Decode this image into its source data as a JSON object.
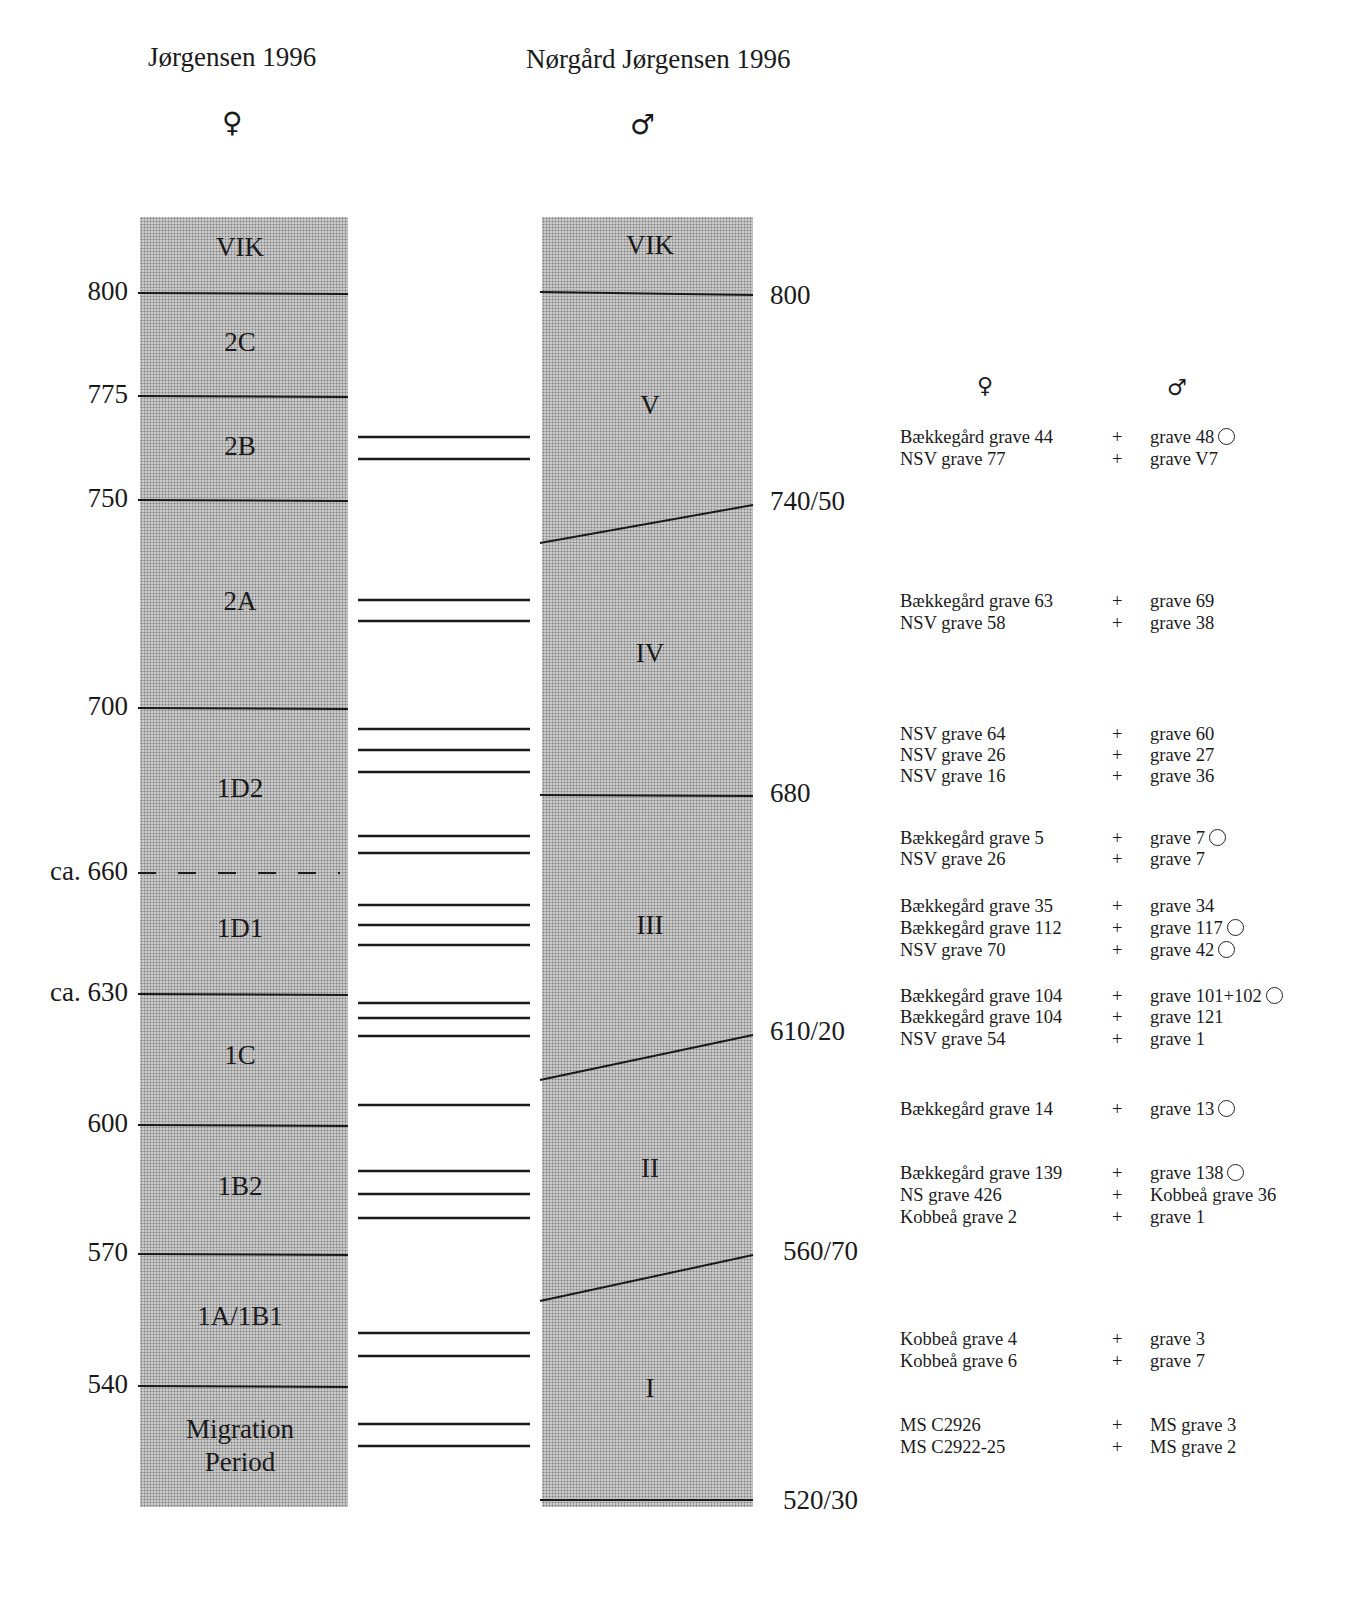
{
  "header": {
    "left_title": "Jørgensen 1996",
    "left_symbol": "♀",
    "right_title": "Nørgård Jørgensen 1996",
    "right_symbol": "♂"
  },
  "left_column": {
    "phases": [
      {
        "label": "VIK",
        "y": 249
      },
      {
        "label": "2C",
        "y": 344
      },
      {
        "label": "2B",
        "y": 448
      },
      {
        "label": "2A",
        "y": 603
      },
      {
        "label": "1D2",
        "y": 790
      },
      {
        "label": "1D1",
        "y": 930
      },
      {
        "label": "1C",
        "y": 1057
      },
      {
        "label": "1B2",
        "y": 1188
      },
      {
        "label": "1A/1B1",
        "y": 1318
      },
      {
        "label": "Migration",
        "y": 1430
      },
      {
        "label": "Period",
        "y": 1463
      }
    ],
    "boundaries": [
      {
        "label": "800",
        "y": 293,
        "style": "solid"
      },
      {
        "label": "775",
        "y": 396,
        "style": "solid"
      },
      {
        "label": "750",
        "y": 500,
        "style": "solid"
      },
      {
        "label": "700",
        "y": 708,
        "style": "solid"
      },
      {
        "label": "ca. 660",
        "y": 873,
        "style": "dashed"
      },
      {
        "label": "ca. 630",
        "y": 994,
        "style": "solid"
      },
      {
        "label": "600",
        "y": 1125,
        "style": "solid"
      },
      {
        "label": "570",
        "y": 1254,
        "style": "solid"
      },
      {
        "label": "540",
        "y": 1386,
        "style": "solid"
      }
    ]
  },
  "right_column": {
    "phases": [
      {
        "label": "VIK",
        "y": 247
      },
      {
        "label": "V",
        "y": 407
      },
      {
        "label": "IV",
        "y": 655
      },
      {
        "label": "III",
        "y": 927
      },
      {
        "label": "II",
        "y": 1170
      },
      {
        "label": "I",
        "y": 1390
      }
    ],
    "boundaries": [
      {
        "label": "800",
        "y_left": 292,
        "y_right": 295,
        "label_y": 297
      },
      {
        "label": "740/50",
        "y_left": 543,
        "y_right": 505,
        "label_y": 503
      },
      {
        "label": "680",
        "y_left": 795,
        "y_right": 796,
        "label_y": 795
      },
      {
        "label": "610/20",
        "y_left": 1080,
        "y_right": 1035,
        "label_y": 1033
      },
      {
        "label": "560/70",
        "y_left": 1301,
        "y_right": 1255,
        "label_y": 1253
      },
      {
        "label": "520/30",
        "y_left": 1500,
        "y_right": 1500,
        "label_y": 1502
      }
    ]
  },
  "links": [
    437,
    459,
    600,
    621,
    729,
    750,
    772,
    836,
    853,
    905,
    925,
    945,
    1003,
    1018,
    1036,
    1105,
    1171,
    1194,
    1218,
    1333,
    1356,
    1424,
    1446
  ],
  "pairs_header": {
    "female": "♀",
    "male": "♂"
  },
  "pairs": [
    {
      "female": "Bækkegård grave 44",
      "male": "grave 48",
      "circle": true,
      "y": 438
    },
    {
      "female": "NSV grave 77",
      "male": "grave V7",
      "circle": false,
      "y": 460
    },
    {
      "female": "Bækkegård grave 63",
      "male": "grave 69",
      "circle": false,
      "y": 602
    },
    {
      "female": "NSV grave 58",
      "male": "grave 38",
      "circle": false,
      "y": 624
    },
    {
      "female": "NSV grave 64",
      "male": "grave 60",
      "circle": false,
      "y": 735
    },
    {
      "female": "NSV grave 26",
      "male": "grave 27",
      "circle": false,
      "y": 756
    },
    {
      "female": "NSV grave 16",
      "male": "grave 36",
      "circle": false,
      "y": 777
    },
    {
      "female": "Bækkegård grave 5",
      "male": "grave 7",
      "circle": true,
      "y": 839
    },
    {
      "female": "NSV grave 26",
      "male": "grave 7",
      "circle": false,
      "y": 860
    },
    {
      "female": "Bækkegård grave 35",
      "male": "grave 34",
      "circle": false,
      "y": 907
    },
    {
      "female": "Bækkegård grave 112",
      "male": "grave 117",
      "circle": true,
      "y": 929
    },
    {
      "female": "NSV grave 70",
      "male": "grave 42",
      "circle": true,
      "y": 951
    },
    {
      "female": "Bækkegård grave 104",
      "male": "grave 101+102",
      "circle": true,
      "y": 997
    },
    {
      "female": "Bækkegård grave 104",
      "male": "grave 121",
      "circle": false,
      "y": 1018
    },
    {
      "female": "NSV grave 54",
      "male": "grave 1",
      "circle": false,
      "y": 1040
    },
    {
      "female": "Bækkegård grave 14",
      "male": "grave 13",
      "circle": true,
      "y": 1110
    },
    {
      "female": "Bækkegård grave 139",
      "male": "grave 138",
      "circle": true,
      "y": 1174
    },
    {
      "female": "NS grave 426",
      "male": "Kobbeå grave 36",
      "circle": false,
      "y": 1196
    },
    {
      "female": "Kobbeå grave 2",
      "male": "grave 1",
      "circle": false,
      "y": 1218
    },
    {
      "female": "Kobbeå grave 4",
      "male": "grave 3",
      "circle": false,
      "y": 1340
    },
    {
      "female": "Kobbeå grave 6",
      "male": "grave 7",
      "circle": false,
      "y": 1362
    },
    {
      "female": "MS C2926",
      "male": "MS grave 3",
      "circle": false,
      "y": 1426
    },
    {
      "female": "MS C2922-25",
      "male": "MS grave 2",
      "circle": false,
      "y": 1448
    }
  ],
  "plus_sign": "+"
}
